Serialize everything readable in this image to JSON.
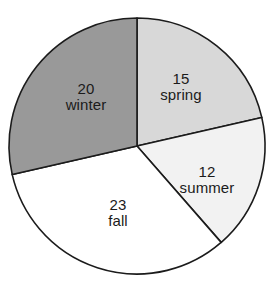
{
  "chart_data": {
    "type": "pie",
    "title": "",
    "subtitle": "",
    "xlabel": "",
    "ylabel": "",
    "legend": "none",
    "grid": false,
    "total": 70,
    "start_angle_deg": 0,
    "direction": "clockwise",
    "categories": [
      "spring",
      "summer",
      "fall",
      "winter"
    ],
    "values": [
      15,
      12,
      23,
      20
    ],
    "slices": [
      {
        "label": "spring",
        "value": "15",
        "value_number": 15,
        "color": "#d8d8d8",
        "start_deg": 0,
        "sweep_deg": 77.1,
        "label_x": 181,
        "label_y": 87
      },
      {
        "label": "summer",
        "value": "12",
        "value_number": 12,
        "color": "#f2f2f2",
        "start_deg": 77.1,
        "sweep_deg": 61.7,
        "label_x": 207,
        "label_y": 180
      },
      {
        "label": "fall",
        "value": "23",
        "value_number": 23,
        "color": "#ffffff",
        "start_deg": 138.9,
        "sweep_deg": 118.3,
        "label_x": 118,
        "label_y": 213
      },
      {
        "label": "winter",
        "value": "20",
        "value_number": 20,
        "color": "#999999",
        "start_deg": 257.1,
        "sweep_deg": 102.9,
        "label_x": 86,
        "label_y": 97
      }
    ],
    "geometry": {
      "center_x": 137,
      "center_y": 146,
      "radius": 128
    },
    "stroke_color": "#1b1b1b",
    "stroke_width": 1.6,
    "background": "#ffffff"
  }
}
